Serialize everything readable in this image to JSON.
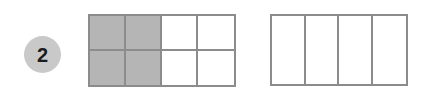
{
  "problem": {
    "number": "2",
    "badge_color": "#c9c9c9",
    "badge_text_color": "#1c1c1c"
  },
  "colors": {
    "background": "#ffffff",
    "grid_line": "#8c8c8c",
    "shaded_fill": "#b5b5b5",
    "unshaded_fill": "#ffffff"
  },
  "models": [
    {
      "name": "model-a",
      "columns": 4,
      "rows": 2,
      "total_parts": 8,
      "shaded_parts": 4,
      "cells": [
        "shaded",
        "shaded",
        "unshaded",
        "unshaded",
        "shaded",
        "shaded",
        "unshaded",
        "unshaded"
      ]
    },
    {
      "name": "model-b",
      "columns": 4,
      "rows": 1,
      "total_parts": 4,
      "shaded_parts": 0,
      "cells": [
        "unshaded",
        "unshaded",
        "unshaded",
        "unshaded"
      ]
    }
  ]
}
